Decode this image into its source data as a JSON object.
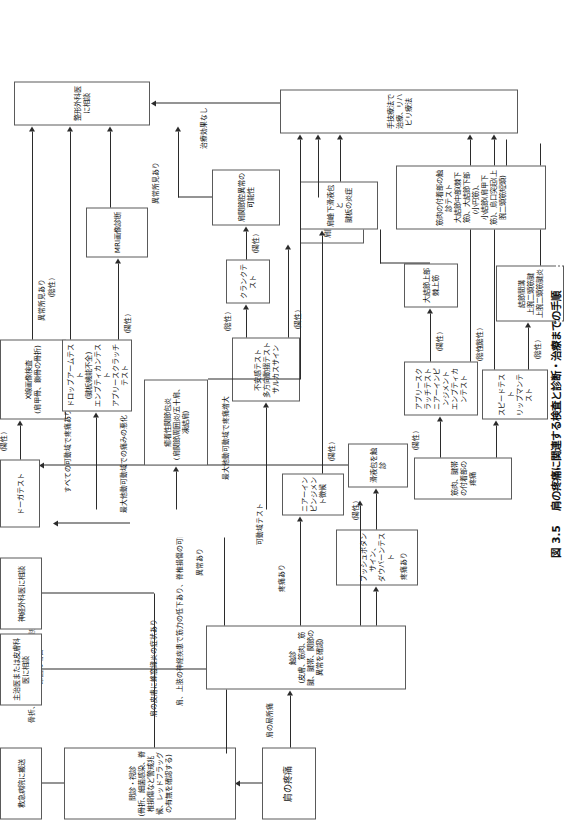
{
  "figure": {
    "caption_number": "図 3.5",
    "caption_text": "肩の疼痛に関連する検査と診断・治療までの手順"
  },
  "nodes": {
    "start": "肩の疼痛",
    "history": "問診・視診\n(骨折、細菌感染、脊椎損傷など警戒兆候、レッドフラッグの有無を確認する)",
    "emergency": "救急病院に搬送",
    "primary_or_derm": "主治医または皮膚科医に相談",
    "neurosurgeon": "神経外科医に相談",
    "palpation": "触診\n(皮膚、筋肉、筋腱、腱帯、関節の異常を確認)",
    "push_button": "プッシュボタンサイン、\nダウバーンテスト",
    "bursa_palpation": "滑液包を触診",
    "dawbarn_test": "ドーガテスト",
    "xray": "X線画像検査\n(肩甲骨、鎖骨の骨折)",
    "neer_impingement": "ニアーインピンジメント徴候",
    "rom_test": "可動域テスト",
    "adhesive_capsulitis": "癒着性関節包炎\n(肩関節周囲炎/五十肩、凍結肩)",
    "instability_tests": "不安感テスト\n多方向動揺テスト\nサルカスサイン",
    "crank_test": "クランクテスト",
    "labrum_abnormality": "肩関節腔異常の可能性",
    "instability_diag": "肩関節不安定症",
    "dropfarm_tests": "ドロップアームテスト\n(腱板機能不全)\nエンプティカンテスト\nアプリースクラッチテスト",
    "mri": "MRI画像診断",
    "ortho": "整形外科医に相談",
    "muscle_attach_pain": "筋肉、腱帯の付着部の疼痛",
    "apley_neer_empty": "アプリースクラッチテスト\nニアーインピンジメント\nエンプティカンテスト",
    "supraspinatus": "大結節上部\n棘上筋",
    "subacromial": "肩峰下滑液包と\n腱板の炎症",
    "speed_yergason": "スピードテスト\nリップマンテスト",
    "bicipital_groove": "結節間溝\n上腕二頭筋腱\n上腕二頭筋腱炎",
    "attach_palp_tests": "筋肉の付着部の触診テスト\n大結節中部(棘下筋)、大結節下部(小円筋)、\n小結節(肩甲下筋)、烏口突起(上腕二頭筋短頭)",
    "manual_therapy": "手技療法で治療、リハビリ療法"
  },
  "edge_labels": {
    "fracture_cardiac": "骨折、脱臼、心臓または内臓疾患が\n原因の場合",
    "cellulitis": "肩の皮膚に蜂窩織炎の症状あり",
    "nerve_weakness": "肩、上肢の神経疾患で筋力の低下あり、脊椎損傷の可能性あり",
    "abnormal": "異常あり",
    "local_pain": "肩の局所痛",
    "pain_present": "疼痛あり",
    "pain_present2": "疼痛あり",
    "positive1": "(陽性)",
    "positive2": "(陽性)",
    "positive3": "(陽性)",
    "positive4": "(陽性)",
    "positive5": "(陽性)",
    "positive6": "(陽性)",
    "positive7": "(陽性)",
    "positive8": "(陽性)",
    "negative1": "(陰性)",
    "negative2": "(陰性)",
    "negative3": "(陰性)",
    "negative4": "(陰性)",
    "negative5": "(陰性)",
    "abnormal_xray": "異常所見あり",
    "abnormal_mri": "異常所見あり",
    "pain_all_rom": "すべての可動域で疼痛あり",
    "pain_max_passive": "最大他動可動域での痛みの悪化",
    "pain_increase_max": "最大他動可動域で疼痛増大",
    "no_effect": "治療効果なし"
  }
}
